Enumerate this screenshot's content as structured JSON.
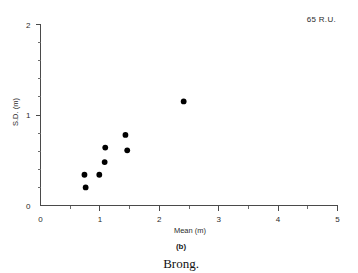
{
  "figure": {
    "annotation": "65 R.U.",
    "panel_label": "(b)",
    "caption": "Brong."
  },
  "chart_data": {
    "type": "scatter",
    "title": "",
    "xlabel": "Mean (m)",
    "ylabel": "S.D. (m)",
    "xlim": [
      0,
      5
    ],
    "ylim": [
      0,
      2
    ],
    "xticks": [
      0,
      1,
      2,
      3,
      4,
      5
    ],
    "xtick_labels": [
      "0",
      "1",
      "2",
      "3",
      "4",
      "5"
    ],
    "yticks": [
      0,
      1,
      2
    ],
    "ytick_labels": [
      "0",
      "1",
      "2"
    ],
    "x_minor_step": 0.5,
    "y_minor_step": 0.2,
    "grid": false,
    "legend": false,
    "annotation": "65 R.U.",
    "marker": "filled-circle",
    "marker_color": "#000000",
    "points": [
      {
        "x": 0.76,
        "y": 0.2
      },
      {
        "x": 0.74,
        "y": 0.34
      },
      {
        "x": 0.99,
        "y": 0.34
      },
      {
        "x": 1.08,
        "y": 0.48
      },
      {
        "x": 1.09,
        "y": 0.64
      },
      {
        "x": 1.46,
        "y": 0.61
      },
      {
        "x": 1.43,
        "y": 0.78
      },
      {
        "x": 2.41,
        "y": 1.15
      }
    ]
  }
}
